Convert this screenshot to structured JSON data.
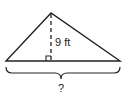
{
  "diagram": {
    "type": "triangle-with-altitude",
    "height_label": "9 ft",
    "base_label": "?",
    "stroke_color": "#222222",
    "background": "#ffffff",
    "vertices": {
      "apex": [
        51,
        13
      ],
      "base_left": [
        6,
        61
      ],
      "base_right": [
        120,
        61
      ]
    },
    "altitude_foot": [
      51,
      61
    ],
    "right_angle_marker": true
  }
}
